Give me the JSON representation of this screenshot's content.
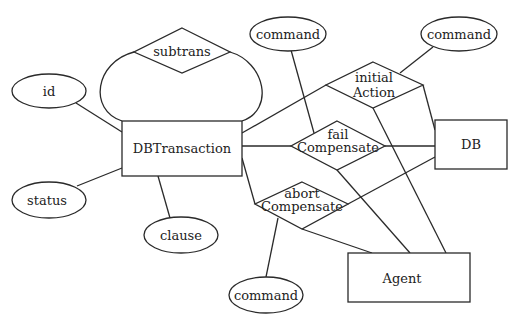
{
  "diagram": {
    "type": "entity-relationship",
    "colors": {
      "stroke": "#2a2a2a",
      "text": "#222222",
      "background": "#ffffff"
    },
    "entities": [
      {
        "id": "dbtransaction",
        "label": "DBTransaction"
      },
      {
        "id": "db",
        "label": "DB"
      },
      {
        "id": "agent",
        "label": "Agent"
      }
    ],
    "relationships": [
      {
        "id": "subtrans",
        "label": "subtrans"
      },
      {
        "id": "initial_action",
        "line1": "initial",
        "line2": "Action"
      },
      {
        "id": "fail_compensate",
        "line1": "fail",
        "line2": "Compensate"
      },
      {
        "id": "abort_compensate",
        "line1": "abort",
        "line2": "Compensate"
      }
    ],
    "attributes": [
      {
        "id": "id",
        "label": "id",
        "owner": "DBTransaction"
      },
      {
        "id": "status",
        "label": "status",
        "owner": "DBTransaction"
      },
      {
        "id": "clause",
        "label": "clause",
        "owner": "DBTransaction"
      },
      {
        "id": "command_fail",
        "label": "command",
        "owner": "fail Compensate"
      },
      {
        "id": "command_initial",
        "label": "command",
        "owner": "initial Action"
      },
      {
        "id": "command_abort",
        "label": "command",
        "owner": "abort Compensate"
      }
    ],
    "connections": [
      [
        "DBTransaction",
        "subtrans"
      ],
      [
        "DBTransaction",
        "initial Action"
      ],
      [
        "DBTransaction",
        "fail Compensate"
      ],
      [
        "DBTransaction",
        "abort Compensate"
      ],
      [
        "initial Action",
        "DB"
      ],
      [
        "initial Action",
        "Agent"
      ],
      [
        "fail Compensate",
        "DB"
      ],
      [
        "fail Compensate",
        "Agent"
      ],
      [
        "abort Compensate",
        "DB"
      ],
      [
        "abort Compensate",
        "Agent"
      ]
    ]
  }
}
